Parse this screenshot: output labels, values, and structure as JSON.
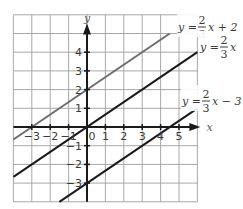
{
  "chart_data": {
    "type": "line",
    "title": "",
    "xlabel": "x",
    "ylabel": "y",
    "xlim": [
      -4,
      6
    ],
    "ylim": [
      -4,
      6
    ],
    "grid": true,
    "x_ticks": [
      -3,
      -2,
      -1,
      0,
      1,
      2,
      3,
      4,
      5
    ],
    "y_ticks": [
      -3,
      -2,
      -1,
      1,
      2,
      3,
      4
    ],
    "x_tick_labels": [
      "−3",
      "−2",
      "−1",
      "0",
      "1",
      "2",
      "3",
      "4",
      "5"
    ],
    "y_tick_labels": [
      "−3",
      "−2",
      "−1",
      "1",
      "2",
      "3",
      "4"
    ],
    "series": [
      {
        "name": "y = 2/3 x + 2",
        "label_parts": {
          "lhs": "y =",
          "num": "2",
          "den": "3",
          "rhs": "x + 2"
        },
        "slope": 0.6667,
        "intercept": 2,
        "x": [
          -4,
          4.5
        ],
        "y": [
          -0.67,
          5
        ],
        "color": "#6e6e6e"
      },
      {
        "name": "y = 2/3 x",
        "label_parts": {
          "lhs": "y =",
          "num": "2",
          "den": "3",
          "rhs": "x"
        },
        "slope": 0.6667,
        "intercept": 0,
        "x": [
          -4,
          6
        ],
        "y": [
          -2.67,
          4
        ],
        "color": "#1a1a1a"
      },
      {
        "name": "y = 2/3 x − 3",
        "label_parts": {
          "lhs": "y =",
          "num": "2",
          "den": "3",
          "rhs": "x − 3"
        },
        "slope": 0.6667,
        "intercept": -3,
        "x": [
          -1.5,
          6
        ],
        "y": [
          -4,
          1
        ],
        "color": "#1a1a1a"
      }
    ]
  }
}
